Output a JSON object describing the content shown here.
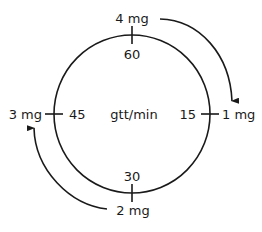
{
  "diagram": {
    "center_label": "gtt/min",
    "dial_marks": [
      {
        "position": "top",
        "rate": "60",
        "dose": "4 mg"
      },
      {
        "position": "right",
        "rate": "15",
        "dose": "1 mg"
      },
      {
        "position": "bottom",
        "rate": "30",
        "dose": "2 mg"
      },
      {
        "position": "left",
        "rate": "45",
        "dose": "3 mg"
      }
    ],
    "arrows": [
      {
        "from": "4 mg",
        "to": "1 mg",
        "direction": "clockwise"
      },
      {
        "from": "2 mg",
        "to": "3 mg",
        "direction": "clockwise"
      }
    ],
    "colors": {
      "line": "#1a1a1a",
      "background": "#ffffff"
    }
  }
}
